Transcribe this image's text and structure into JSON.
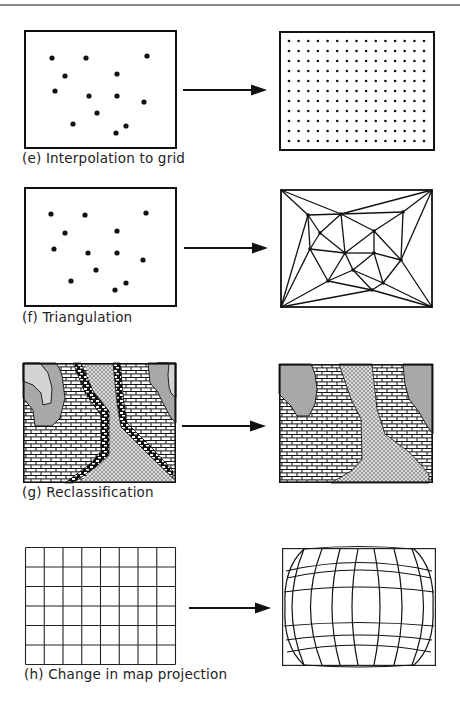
{
  "figure": {
    "panels": [
      {
        "id": "e",
        "caption": "(e) Interpolation to grid",
        "input": "scattered points",
        "output": "regular point grid",
        "grid_columns": 15,
        "grid_rows": 11
      },
      {
        "id": "f",
        "caption": "(f) Triangulation",
        "input": "scattered points",
        "output": "triangulated irregular network"
      },
      {
        "id": "g",
        "caption": "(g) Reclassification",
        "input": "map with five classes (two grey, brick, dotted-brick boundary, crosshatch)",
        "output": "map with three classes (grey, brick, crosshatch)"
      },
      {
        "id": "h",
        "caption": "(h) Change in map projection",
        "input": "rectangular graticule",
        "output": "curved graticule",
        "grid_columns": 8,
        "grid_rows": 6
      }
    ],
    "colors": {
      "ink": "#111111",
      "grey_fill": "#a8a8a8",
      "light_grey_fill": "#d4d4d4",
      "rule": "#8a8a8a"
    }
  }
}
